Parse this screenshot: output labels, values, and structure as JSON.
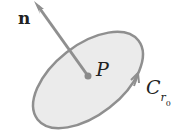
{
  "diagram": {
    "normal_label": "n",
    "point_label": "P",
    "curve_label_main": "C",
    "curve_label_sub": "r",
    "curve_label_subsub": "0",
    "colors": {
      "fill": "#ebebeb",
      "stroke": "#8f8f8f",
      "text": "#222222"
    }
  }
}
